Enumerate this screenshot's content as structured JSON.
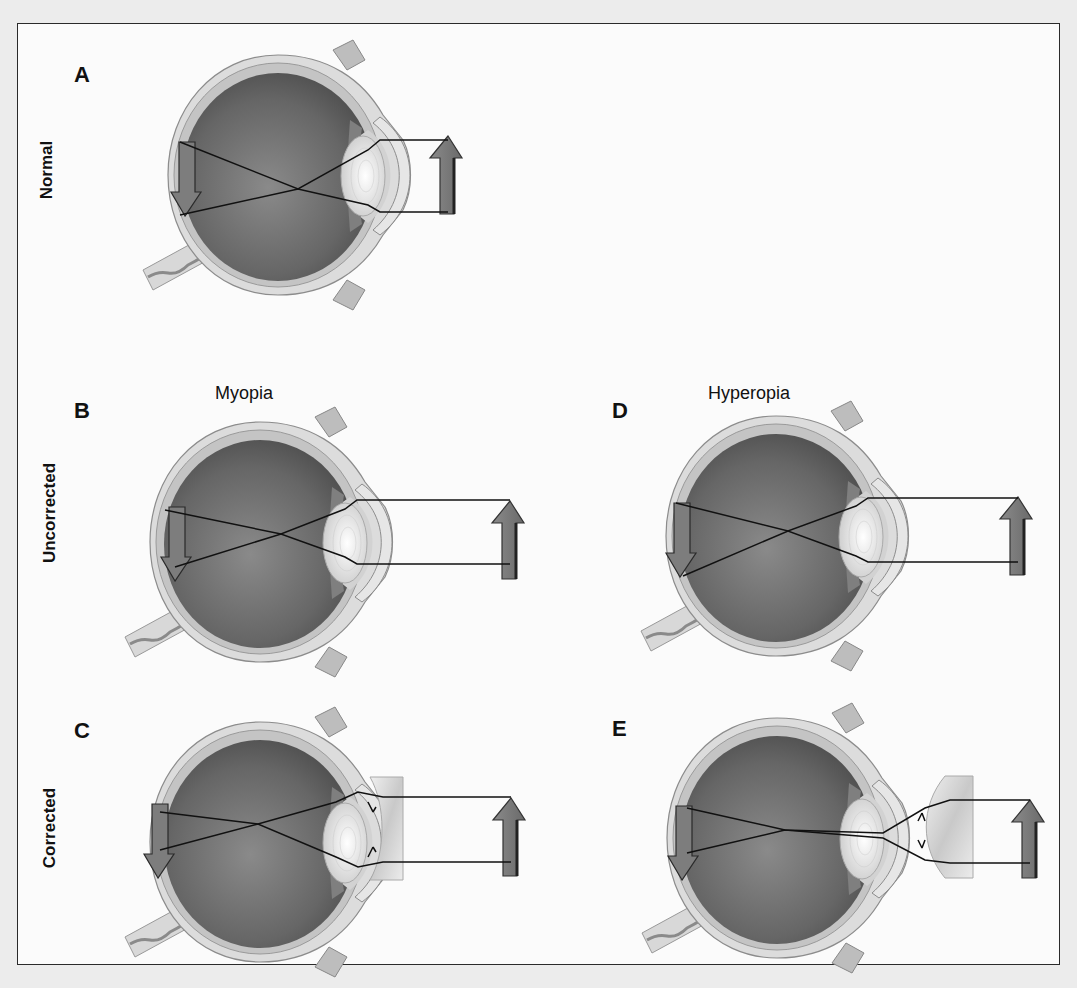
{
  "figure": {
    "row_labels": {
      "normal": "Normal",
      "uncorrected": "Uncorrected",
      "corrected": "Corrected"
    },
    "condition_titles": {
      "myopia": "Myopia",
      "hyperopia": "Hyperopia"
    },
    "panels": [
      {
        "letter": "A",
        "row": "Normal",
        "condition": "normal",
        "lens": "none",
        "focus": "on retina"
      },
      {
        "letter": "B",
        "row": "Uncorrected",
        "condition": "Myopia",
        "lens": "none",
        "focus": "in front of retina"
      },
      {
        "letter": "C",
        "row": "Corrected",
        "condition": "Myopia",
        "lens": "concave",
        "focus": "on retina"
      },
      {
        "letter": "D",
        "row": "Uncorrected",
        "condition": "Hyperopia",
        "lens": "none",
        "focus": "behind retina"
      },
      {
        "letter": "E",
        "row": "Corrected",
        "condition": "Hyperopia",
        "lens": "convex",
        "focus": "on retina"
      }
    ],
    "colors": {
      "background": "#ececec",
      "frame": "#fbfbfb",
      "sclera": "#d9d9d9",
      "vitreous": "#6e6e6e",
      "lens": "#efefef",
      "arrow": "#7a7a7a",
      "ray": "#111111"
    }
  }
}
